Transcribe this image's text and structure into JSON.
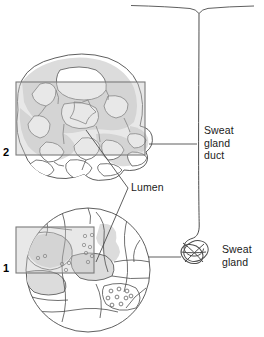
{
  "figure": {
    "background_color": "#ffffff",
    "stroke_color": "#4d4d4d",
    "dark_stroke_color": "#333333",
    "cell_fill_color": "#dcdcdc",
    "box_fill_color": "#d9d9d9",
    "box_stroke_color": "#808080",
    "width": 264,
    "height": 337
  },
  "labels": {
    "sweat_gland_duct": "Sweat\ngland\nduct",
    "sweat_gland": "Sweat\ngland",
    "lumen": "Lumen",
    "inset_2_number": "2",
    "inset_1_number": "1"
  },
  "anatomy": {
    "skin_surface": "skin-surface-line",
    "pore": "sweat-pore",
    "duct": "sweat-gland-duct-tube",
    "coil": "coiled-secretory-gland",
    "inset_1": "low-magnification-circular-section",
    "inset_2": "high-magnification-cell-detail",
    "lumen_marker": "lumen-central-cavity",
    "granules": "secretory-granules"
  },
  "leader_lines": {
    "duct_leader": "inset-2-to-duct",
    "gland_leader": "inset-1-to-coil",
    "lumen_leader_upper": "lumen-to-inset-2",
    "lumen_leader_lower": "lumen-to-inset-1"
  }
}
